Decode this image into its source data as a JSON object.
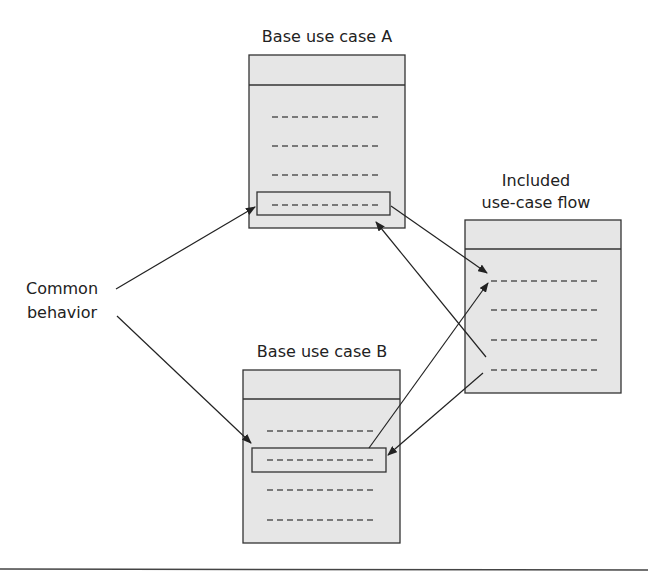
{
  "diagram": {
    "colors": {
      "box_fill": "#e6e6e6",
      "stroke": "#333333",
      "dash": "#555555"
    },
    "labels": {
      "base_a": "Base use case A",
      "base_b": "Base use case B",
      "included_line1": "Included",
      "included_line2": "use-case flow",
      "common_line1": "Common",
      "common_line2": "behavior"
    },
    "boxes": [
      {
        "id": "base-a",
        "title": "Base use case A",
        "steps": 4,
        "highlighted_step": 4
      },
      {
        "id": "included",
        "title": "Included use-case flow",
        "steps": 4
      },
      {
        "id": "base-b",
        "title": "Base use case B",
        "steps": 4,
        "highlighted_step": 2
      }
    ],
    "arrows": [
      {
        "from": "common-behavior",
        "to": "base-a step 4"
      },
      {
        "from": "common-behavior",
        "to": "base-b step 2"
      },
      {
        "from": "base-a step 4",
        "to": "included step 1"
      },
      {
        "from": "included step 4",
        "to": "base-a step 4"
      },
      {
        "from": "base-b step 2",
        "to": "included step 1"
      },
      {
        "from": "included step 4",
        "to": "base-b step 2"
      }
    ]
  }
}
